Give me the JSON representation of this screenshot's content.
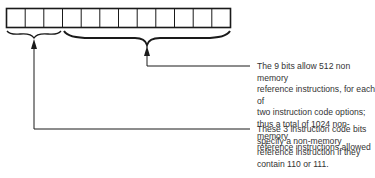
{
  "register": {
    "bit_count": 12,
    "fields": [
      {
        "name": "instruction-code-bits",
        "bits": 3
      },
      {
        "name": "operation-bits",
        "bits": 9
      }
    ]
  },
  "annotations": {
    "operation_bits_note": "The 9 bits allow 512 non memory\nreference instructions, for each of\ntwo instruction code options;\nthus a total of 1024 non-memory\nreference instructions allowed",
    "instruction_code_note": "These 3 instruction code bits\nspecify a non-memory\nreference instruction if they\ncontain 110 or 111."
  },
  "colors": {
    "stroke": "#1a1a1a",
    "text": "#333333"
  }
}
